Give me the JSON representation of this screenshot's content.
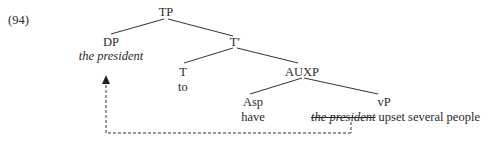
{
  "example_number": "(94)",
  "nodes": {
    "tp": "TP",
    "dp": "DP",
    "dp_content": "the president",
    "t_bar": "T′",
    "t": "T",
    "t_content": "to",
    "auxp": "AUXP",
    "asp": "Asp",
    "asp_content": "have",
    "vp": "vP",
    "vp_trace": "the president",
    "vp_rest": "upset several people"
  },
  "movement": {
    "from": "vP subject (the president, struck through)",
    "to": "DP spec-TP",
    "style": "dashed arrow"
  }
}
